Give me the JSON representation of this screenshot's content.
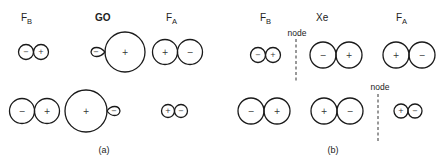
{
  "panel_a": {
    "caption": "(a)",
    "labels": {
      "fb": {
        "main": "F",
        "sub": "B"
      },
      "center": "GO",
      "fa": {
        "main": "F",
        "sub": "A"
      }
    },
    "row1": {
      "fb_pair": [
        "−",
        "+"
      ],
      "go_lobes": {
        "small": "−",
        "large": "+"
      },
      "fa_pair": [
        "+",
        "−"
      ]
    },
    "row2": {
      "fb_pair": [
        "−",
        "+"
      ],
      "go_lobes": {
        "large": "+",
        "small": "−"
      },
      "fa_pair": [
        "+",
        "−"
      ]
    }
  },
  "panel_b": {
    "caption": "(b)",
    "labels": {
      "fb": {
        "main": "F",
        "sub": "B"
      },
      "center": "Xe",
      "fa": {
        "main": "F",
        "sub": "A"
      }
    },
    "node_label": "node",
    "row1": {
      "fb_pair": [
        "−",
        "+"
      ],
      "xe_pair": [
        "−",
        "+"
      ],
      "fa_pair": [
        "+",
        "−"
      ]
    },
    "row2": {
      "fb_pair": [
        "−",
        "+"
      ],
      "xe_pair": [
        "+",
        "−"
      ],
      "fa_pair": [
        "+",
        "−"
      ]
    }
  }
}
